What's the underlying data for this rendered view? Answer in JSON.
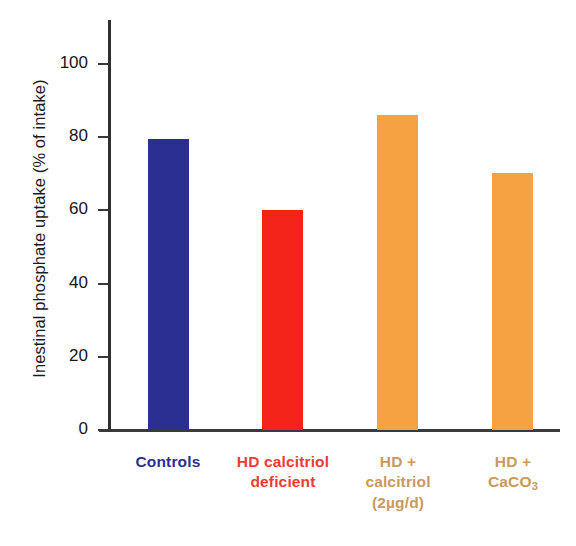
{
  "chart_data": {
    "type": "bar",
    "title": "",
    "xlabel": "",
    "ylabel": "Inestinal phosphate uptake (% of intake)",
    "ylim": [
      0,
      112
    ],
    "yticks": [
      0,
      20,
      40,
      60,
      80,
      100
    ],
    "ytick_labels": [
      "0",
      "20",
      "40",
      "60",
      "80",
      "100"
    ],
    "grid": false,
    "legend": "none",
    "categories": [
      "Controls",
      "HD calcitriol deficient",
      "HD + calcitriol (2µg/d)",
      "HD + CaCO3"
    ],
    "values": [
      79.5,
      60,
      86,
      70
    ],
    "bar_colors": [
      "#2b2f8f",
      "#f4231a",
      "#f5a342",
      "#f5a342"
    ],
    "label_colors": [
      "#2b2f8f",
      "#ef3b33",
      "#c99a5d",
      "#c99a5d"
    ]
  },
  "axis": {
    "y_title": "Inestinal phosphate uptake (% of intake)",
    "ticks": [
      {
        "value": 100,
        "label": "100"
      },
      {
        "value": 80,
        "label": "80"
      },
      {
        "value": 60,
        "label": "60"
      },
      {
        "value": 40,
        "label": "40"
      },
      {
        "value": 20,
        "label": "20"
      },
      {
        "value": 0,
        "label": "0"
      }
    ]
  },
  "bars": [
    {
      "name": "controls",
      "value": 79.5,
      "color": "#2b2f8f",
      "label_color": "#2b2f8f",
      "label_lines": [
        "Controls"
      ]
    },
    {
      "name": "hd-calcitriol-deficient",
      "value": 60,
      "color": "#f4231a",
      "label_color": "#ef3b33",
      "label_lines": [
        "HD calcitriol",
        "deficient"
      ]
    },
    {
      "name": "hd-plus-calcitriol",
      "value": 86,
      "color": "#f5a342",
      "label_color": "#c99a5d",
      "label_lines": [
        "HD +",
        "calcitriol",
        "(2µg/d)"
      ]
    },
    {
      "name": "hd-plus-caco3",
      "value": 70,
      "color": "#f5a342",
      "label_color": "#c99a5d",
      "label_lines": [
        "HD +",
        "CaCO",
        "3"
      ]
    }
  ],
  "labels": {
    "cat0_l0": "Controls",
    "cat1_l0": "HD calcitriol",
    "cat1_l1": "deficient",
    "cat2_l0": "HD +",
    "cat2_l1": "calcitriol",
    "cat2_l2": "(2µg/d)",
    "cat3_l0": "HD +",
    "cat3_l1": "CaCO",
    "cat3_sub": "3"
  },
  "ticklabels": {
    "t100": "100",
    "t80": "80",
    "t60": "60",
    "t40": "40",
    "t20": "20",
    "t0": "0"
  }
}
